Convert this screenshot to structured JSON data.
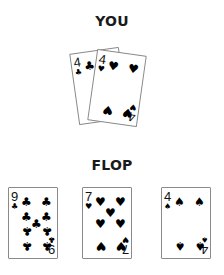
{
  "you": {
    "heading": "YOU",
    "cards": [
      {
        "rank": "4",
        "suit": "clubs",
        "suit_symbol": "♣",
        "color": "#000000"
      },
      {
        "rank": "4",
        "suit": "hearts",
        "suit_symbol": "♥",
        "color": "#000000"
      }
    ]
  },
  "flop": {
    "heading": "FLOP",
    "cards": [
      {
        "rank": "9",
        "suit": "clubs",
        "suit_symbol": "♣",
        "color": "#000000"
      },
      {
        "rank": "7",
        "suit": "hearts",
        "suit_symbol": "♥",
        "color": "#000000"
      },
      {
        "rank": "4",
        "suit": "spades",
        "suit_symbol": "♠",
        "color": "#000000"
      }
    ]
  }
}
